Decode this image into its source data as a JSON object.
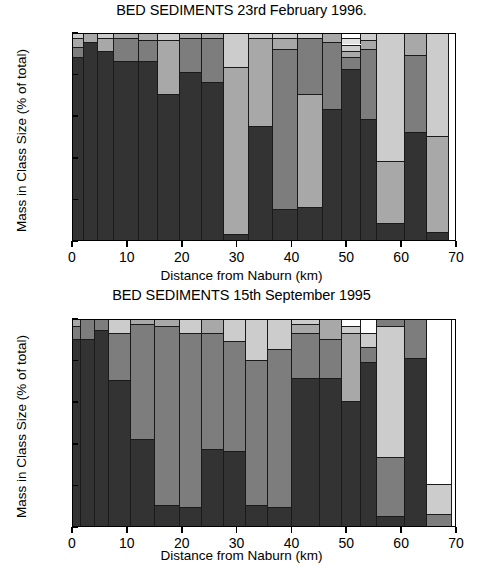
{
  "figure": {
    "ylabel": "Mass in Class Size (% of total)",
    "xlabel": "Distance from Naburn (km)",
    "ytick_labels": [
      "0",
      "20",
      "40",
      "60",
      "80",
      "100"
    ],
    "xtick_labels": [
      "0",
      "10",
      "20",
      "30",
      "40",
      "50",
      "60",
      "70"
    ]
  },
  "palette": {
    "class1": "#333333",
    "class2": "#7d7d7d",
    "class3": "#a8a8a8",
    "class4": "#cccccc",
    "class5": "#e2e2e2",
    "class6": "#ffffff"
  },
  "chart_data": [
    {
      "type": "bar",
      "title": "BED SEDIMENTS 23rd February 1996.",
      "xlabel": "Distance from Naburn (km)",
      "ylabel": "Mass in Class Size (% of total)",
      "xlim": [
        0,
        70
      ],
      "ylim": [
        0,
        100
      ],
      "xticks": [
        0,
        10,
        20,
        30,
        40,
        50,
        60,
        70
      ],
      "yticks": [
        0,
        20,
        40,
        60,
        80,
        100
      ],
      "grid": false,
      "legend": "none",
      "stacked": true,
      "series": [
        {
          "name": "class1",
          "color": "#333333"
        },
        {
          "name": "class2",
          "color": "#7d7d7d"
        },
        {
          "name": "class3",
          "color": "#a8a8a8"
        },
        {
          "name": "class4",
          "color": "#cccccc"
        },
        {
          "name": "class5",
          "color": "#e2e2e2"
        },
        {
          "name": "class6",
          "color": "#ffffff"
        }
      ],
      "bars": [
        {
          "x_start": 0.0,
          "x_end": 2.0,
          "stack": [
            {
              "series": "class1",
              "value": 88
            },
            {
              "series": "class2",
              "value": 5
            },
            {
              "series": "class3",
              "value": 4
            },
            {
              "series": "class4",
              "value": 3
            }
          ]
        },
        {
          "x_start": 2.0,
          "x_end": 4.5,
          "stack": [
            {
              "series": "class1",
              "value": 95
            },
            {
              "series": "class3",
              "value": 5
            }
          ]
        },
        {
          "x_start": 4.5,
          "x_end": 7.5,
          "stack": [
            {
              "series": "class1",
              "value": 91
            },
            {
              "series": "class3",
              "value": 6
            },
            {
              "series": "class4",
              "value": 3
            }
          ]
        },
        {
          "x_start": 7.5,
          "x_end": 12.0,
          "stack": [
            {
              "series": "class1",
              "value": 86
            },
            {
              "series": "class2",
              "value": 11
            },
            {
              "series": "class3",
              "value": 3
            }
          ]
        },
        {
          "x_start": 12.0,
          "x_end": 15.5,
          "stack": [
            {
              "series": "class1",
              "value": 86
            },
            {
              "series": "class2",
              "value": 10
            },
            {
              "series": "class3",
              "value": 4
            }
          ]
        },
        {
          "x_start": 15.5,
          "x_end": 19.5,
          "stack": [
            {
              "series": "class1",
              "value": 70
            },
            {
              "series": "class3",
              "value": 26
            },
            {
              "series": "class4",
              "value": 4
            }
          ]
        },
        {
          "x_start": 19.5,
          "x_end": 23.5,
          "stack": [
            {
              "series": "class1",
              "value": 81
            },
            {
              "series": "class2",
              "value": 16
            },
            {
              "series": "class3",
              "value": 3
            }
          ]
        },
        {
          "x_start": 23.5,
          "x_end": 27.5,
          "stack": [
            {
              "series": "class1",
              "value": 76
            },
            {
              "series": "class2",
              "value": 21
            },
            {
              "series": "class3",
              "value": 3
            }
          ]
        },
        {
          "x_start": 27.5,
          "x_end": 32.0,
          "stack": [
            {
              "series": "class1",
              "value": 3
            },
            {
              "series": "class3",
              "value": 80
            },
            {
              "series": "class4",
              "value": 17
            }
          ]
        },
        {
          "x_start": 32.0,
          "x_end": 36.5,
          "stack": [
            {
              "series": "class1",
              "value": 55
            },
            {
              "series": "class3",
              "value": 42
            },
            {
              "series": "class4",
              "value": 3
            }
          ]
        },
        {
          "x_start": 36.5,
          "x_end": 41.0,
          "stack": [
            {
              "series": "class1",
              "value": 15
            },
            {
              "series": "class2",
              "value": 77
            },
            {
              "series": "class3",
              "value": 5
            },
            {
              "series": "class4",
              "value": 3
            }
          ]
        },
        {
          "x_start": 41.0,
          "x_end": 45.5,
          "stack": [
            {
              "series": "class1",
              "value": 16
            },
            {
              "series": "class3",
              "value": 54
            },
            {
              "series": "class2",
              "value": 27
            },
            {
              "series": "class4",
              "value": 3
            }
          ]
        },
        {
          "x_start": 45.5,
          "x_end": 49.0,
          "stack": [
            {
              "series": "class1",
              "value": 63
            },
            {
              "series": "class2",
              "value": 32
            },
            {
              "series": "class3",
              "value": 5
            }
          ]
        },
        {
          "x_start": 49.0,
          "x_end": 52.5,
          "stack": [
            {
              "series": "class1",
              "value": 82
            },
            {
              "series": "class2",
              "value": 6
            },
            {
              "series": "class3",
              "value": 3
            },
            {
              "series": "class4",
              "value": 3
            },
            {
              "series": "class5",
              "value": 3
            },
            {
              "series": "class6",
              "value": 3
            }
          ]
        },
        {
          "x_start": 52.5,
          "x_end": 55.5,
          "stack": [
            {
              "series": "class1",
              "value": 58
            },
            {
              "series": "class2",
              "value": 34
            },
            {
              "series": "class3",
              "value": 4
            },
            {
              "series": "class4",
              "value": 4
            }
          ]
        },
        {
          "x_start": 55.5,
          "x_end": 60.5,
          "stack": [
            {
              "series": "class1",
              "value": 8
            },
            {
              "series": "class3",
              "value": 30
            },
            {
              "series": "class4",
              "value": 62
            }
          ]
        },
        {
          "x_start": 60.5,
          "x_end": 64.5,
          "stack": [
            {
              "series": "class1",
              "value": 52
            },
            {
              "series": "class2",
              "value": 37
            },
            {
              "series": "class3",
              "value": 11
            }
          ]
        },
        {
          "x_start": 64.5,
          "x_end": 68.5,
          "stack": [
            {
              "series": "class1",
              "value": 4
            },
            {
              "series": "class3",
              "value": 46
            },
            {
              "series": "class4",
              "value": 50
            }
          ]
        }
      ]
    },
    {
      "type": "bar",
      "title": "BED SEDIMENTS 15th September 1995",
      "xlabel": "Distance from Naburn (km)",
      "ylabel": "Mass in Class Size (% of total)",
      "xlim": [
        0,
        70
      ],
      "ylim": [
        0,
        100
      ],
      "xticks": [
        0,
        10,
        20,
        30,
        40,
        50,
        60,
        70
      ],
      "yticks": [
        0,
        20,
        40,
        60,
        80,
        100
      ],
      "grid": false,
      "legend": "none",
      "stacked": true,
      "series": [
        {
          "name": "class1",
          "color": "#333333"
        },
        {
          "name": "class2",
          "color": "#7d7d7d"
        },
        {
          "name": "class3",
          "color": "#a8a8a8"
        },
        {
          "name": "class4",
          "color": "#cccccc"
        },
        {
          "name": "class5",
          "color": "#e2e2e2"
        },
        {
          "name": "class6",
          "color": "#ffffff"
        }
      ],
      "bars": [
        {
          "x_start": 0.0,
          "x_end": 1.5,
          "stack": [
            {
              "series": "class1",
              "value": 90
            },
            {
              "series": "class2",
              "value": 6
            },
            {
              "series": "class3",
              "value": 4
            }
          ]
        },
        {
          "x_start": 1.5,
          "x_end": 4.0,
          "stack": [
            {
              "series": "class1",
              "value": 90
            },
            {
              "series": "class2",
              "value": 10
            }
          ]
        },
        {
          "x_start": 4.0,
          "x_end": 6.5,
          "stack": [
            {
              "series": "class1",
              "value": 94
            },
            {
              "series": "class2",
              "value": 6
            }
          ]
        },
        {
          "x_start": 6.5,
          "x_end": 10.5,
          "stack": [
            {
              "series": "class1",
              "value": 70
            },
            {
              "series": "class2",
              "value": 23
            },
            {
              "series": "class4",
              "value": 7
            }
          ]
        },
        {
          "x_start": 10.5,
          "x_end": 15.0,
          "stack": [
            {
              "series": "class1",
              "value": 42
            },
            {
              "series": "class2",
              "value": 55
            },
            {
              "series": "class3",
              "value": 3
            }
          ]
        },
        {
          "x_start": 15.0,
          "x_end": 19.5,
          "stack": [
            {
              "series": "class1",
              "value": 10
            },
            {
              "series": "class2",
              "value": 86
            },
            {
              "series": "class3",
              "value": 4
            }
          ]
        },
        {
          "x_start": 19.5,
          "x_end": 23.5,
          "stack": [
            {
              "series": "class1",
              "value": 9
            },
            {
              "series": "class2",
              "value": 84
            },
            {
              "series": "class4",
              "value": 7
            }
          ]
        },
        {
          "x_start": 23.5,
          "x_end": 27.5,
          "stack": [
            {
              "series": "class1",
              "value": 37
            },
            {
              "series": "class2",
              "value": 56
            },
            {
              "series": "class3",
              "value": 7
            }
          ]
        },
        {
          "x_start": 27.5,
          "x_end": 31.5,
          "stack": [
            {
              "series": "class1",
              "value": 36
            },
            {
              "series": "class2",
              "value": 53
            },
            {
              "series": "class4",
              "value": 11
            }
          ]
        },
        {
          "x_start": 31.5,
          "x_end": 35.5,
          "stack": [
            {
              "series": "class1",
              "value": 10
            },
            {
              "series": "class2",
              "value": 70
            },
            {
              "series": "class4",
              "value": 20
            }
          ]
        },
        {
          "x_start": 35.5,
          "x_end": 40.0,
          "stack": [
            {
              "series": "class1",
              "value": 9
            },
            {
              "series": "class2",
              "value": 76
            },
            {
              "series": "class4",
              "value": 15
            }
          ]
        },
        {
          "x_start": 40.0,
          "x_end": 45.0,
          "stack": [
            {
              "series": "class1",
              "value": 71
            },
            {
              "series": "class2",
              "value": 22
            },
            {
              "series": "class3",
              "value": 4
            },
            {
              "series": "class4",
              "value": 3
            }
          ]
        },
        {
          "x_start": 45.0,
          "x_end": 49.0,
          "stack": [
            {
              "series": "class1",
              "value": 71
            },
            {
              "series": "class2",
              "value": 19
            },
            {
              "series": "class3",
              "value": 10
            }
          ]
        },
        {
          "x_start": 49.0,
          "x_end": 52.5,
          "stack": [
            {
              "series": "class1",
              "value": 60
            },
            {
              "series": "class3",
              "value": 33
            },
            {
              "series": "class4",
              "value": 3
            },
            {
              "series": "class6",
              "value": 4
            }
          ]
        },
        {
          "x_start": 52.5,
          "x_end": 55.5,
          "stack": [
            {
              "series": "class1",
              "value": 79
            },
            {
              "series": "class2",
              "value": 7
            },
            {
              "series": "class4",
              "value": 7
            },
            {
              "series": "class6",
              "value": 7
            }
          ]
        },
        {
          "x_start": 55.5,
          "x_end": 60.5,
          "stack": [
            {
              "series": "class1",
              "value": 5
            },
            {
              "series": "class2",
              "value": 28
            },
            {
              "series": "class4",
              "value": 63
            },
            {
              "series": "class2b",
              "value": 4
            }
          ]
        },
        {
          "x_start": 60.5,
          "x_end": 64.5,
          "stack": [
            {
              "series": "class1",
              "value": 81
            },
            {
              "series": "class2",
              "value": 19
            }
          ]
        },
        {
          "x_start": 64.5,
          "x_end": 69.0,
          "stack": [
            {
              "series": "class2",
              "value": 6
            },
            {
              "series": "class4",
              "value": 14
            },
            {
              "series": "class6",
              "value": 80
            }
          ]
        }
      ]
    }
  ]
}
